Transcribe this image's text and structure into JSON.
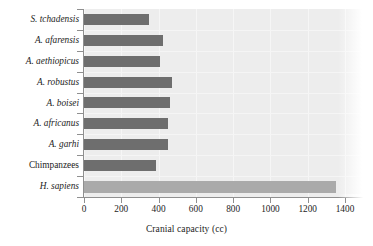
{
  "chart_data": {
    "type": "bar",
    "orientation": "horizontal",
    "title": "",
    "xlabel": "Cranial capacity (cc)",
    "ylabel": "",
    "xlim": [
      0,
      1400
    ],
    "xticks": [
      0,
      200,
      400,
      600,
      800,
      1000,
      1200,
      1400
    ],
    "grid": true,
    "legend": "none",
    "categories": [
      "S. tchadensis",
      "A. afarensis",
      "A. aethiopicus",
      "A. robustus",
      "A. boisei",
      "A. africanus",
      "A. garhi",
      "Chimpanzees",
      "H. sapiens"
    ],
    "values": [
      350,
      425,
      410,
      470,
      460,
      450,
      450,
      385,
      1350
    ],
    "bars": [
      {
        "category": "S. tchadensis",
        "value": 350,
        "italic": true,
        "color": "#6e6e6e"
      },
      {
        "category": "A. afarensis",
        "value": 425,
        "italic": true,
        "color": "#6e6e6e"
      },
      {
        "category": "A. aethiopicus",
        "value": 410,
        "italic": true,
        "color": "#6e6e6e"
      },
      {
        "category": "A. robustus",
        "value": 470,
        "italic": true,
        "color": "#6e6e6e"
      },
      {
        "category": "A. boisei",
        "value": 460,
        "italic": true,
        "color": "#6e6e6e"
      },
      {
        "category": "A. africanus",
        "value": 450,
        "italic": true,
        "color": "#6e6e6e"
      },
      {
        "category": "A. garhi",
        "value": 450,
        "italic": true,
        "color": "#6e6e6e"
      },
      {
        "category": "Chimpanzees",
        "value": 385,
        "italic": false,
        "color": "#6e6e6e"
      },
      {
        "category": "H. sapiens",
        "value": 1350,
        "italic": true,
        "color": "#aaaaaa"
      }
    ],
    "colors": {
      "bar_default": "#6e6e6e",
      "bar_highlight": "#aaaaaa",
      "panel_background": "#ededed",
      "axis_line": "#8f8f8f",
      "text": "#1c1c1c"
    }
  }
}
